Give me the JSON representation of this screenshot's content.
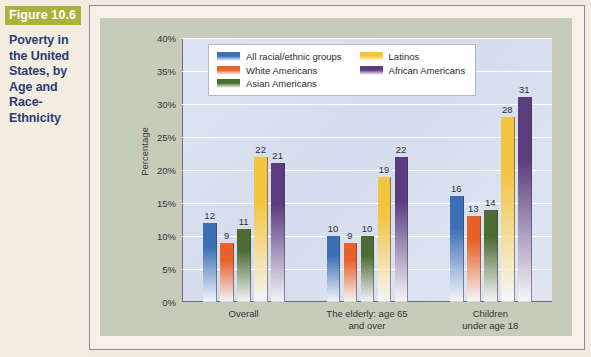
{
  "figure": {
    "badge": "Figure 10.6",
    "title": "Poverty in the United States, by Age and Race-Ethnicity",
    "badge_color": "#a9b23a",
    "title_color": "#2c3e70"
  },
  "legend": {
    "column_left": [
      {
        "label": "All racial/ethnic groups",
        "color": "#3b6fb6",
        "swatch_name": "legend-swatch-all-racial-ethnic-groups"
      },
      {
        "label": "White Americans",
        "color": "#e8622a",
        "swatch_name": "legend-swatch-white-americans"
      },
      {
        "label": "Asian Americans",
        "color": "#4e6b33",
        "swatch_name": "legend-swatch-asian-americans"
      }
    ],
    "column_right": [
      {
        "label": "Latinos",
        "color": "#f3c43f",
        "swatch_name": "legend-swatch-latinos"
      },
      {
        "label": "African Americans",
        "color": "#5b3c7e",
        "swatch_name": "legend-swatch-african-americans"
      }
    ]
  },
  "chart_data": {
    "type": "bar",
    "title": "Poverty in the United States, by Age and Race-Ethnicity",
    "xlabel": "",
    "ylabel": "Percentage",
    "ylim": [
      0,
      40
    ],
    "ytick_step": 5,
    "ytick_labels": [
      "0%",
      "5%",
      "10%",
      "15%",
      "20%",
      "25%",
      "30%",
      "35%",
      "40%"
    ],
    "ytick_values": [
      0,
      5,
      10,
      15,
      20,
      25,
      30,
      35,
      40
    ],
    "grid": true,
    "legend_position": "upper-center-inside",
    "value_labels": true,
    "categories": [
      "Overall",
      "The elderly: age 65\nand over",
      "Children\nunder age 18"
    ],
    "series": [
      {
        "name": "All racial/ethnic groups",
        "color": "#3b6fb6",
        "values": [
          12,
          10,
          16
        ]
      },
      {
        "name": "White Americans",
        "color": "#e8622a",
        "values": [
          9,
          9,
          13
        ]
      },
      {
        "name": "Asian Americans",
        "color": "#4e6b33",
        "values": [
          11,
          10,
          14
        ]
      },
      {
        "name": "Latinos",
        "color": "#f3c43f",
        "values": [
          22,
          19,
          28
        ]
      },
      {
        "name": "African Americans",
        "color": "#5b3c7e",
        "values": [
          21,
          22,
          31
        ]
      }
    ]
  }
}
